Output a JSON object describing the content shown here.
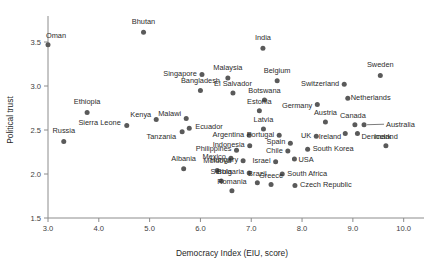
{
  "chart_data": {
    "type": "scatter",
    "title": "",
    "xlabel": "Democracy Index (EIU, score)",
    "ylabel": "Political trust",
    "xlim": [
      3.0,
      10.4
    ],
    "ylim": [
      1.5,
      3.75
    ],
    "xticks": [
      "3.0",
      "4.0",
      "5.0",
      "6.0",
      "7.0",
      "8.0",
      "9.0",
      "10.0"
    ],
    "xtick_values": [
      3.0,
      4.0,
      5.0,
      6.0,
      7.0,
      8.0,
      9.0,
      10.0
    ],
    "yticks": [
      "1.5",
      "2.0",
      "2.5",
      "3.0",
      "3.5"
    ],
    "ytick_values": [
      1.5,
      2.0,
      2.5,
      3.0,
      3.5
    ],
    "grid": false,
    "legend": "none",
    "marker_color": "#5a5a5a",
    "axis_color": "#8c8c8c",
    "points": [
      {
        "label": "Oman",
        "x": 3.0,
        "y": 3.47,
        "lx": 8,
        "ly": -7
      },
      {
        "label": "Russia",
        "x": 3.31,
        "y": 2.37,
        "lx": 0,
        "ly": -8,
        "anchor": "middle"
      },
      {
        "label": "Ethiopia",
        "x": 3.77,
        "y": 2.7,
        "lx": 0,
        "ly": -8,
        "anchor": "middle"
      },
      {
        "label": "Bhutan",
        "x": 4.88,
        "y": 3.61,
        "lx": 0,
        "ly": -8,
        "anchor": "middle"
      },
      {
        "label": "Sierra Leone",
        "x": 4.55,
        "y": 2.55,
        "lx": -6,
        "ly": -1,
        "anchor": "end"
      },
      {
        "label": "Albania",
        "x": 5.67,
        "y": 2.06,
        "lx": 0,
        "ly": -8,
        "anchor": "middle"
      },
      {
        "label": "Kenya",
        "x": 5.13,
        "y": 2.62,
        "lx": -5,
        "ly": -2,
        "anchor": "end"
      },
      {
        "label": "Tanzania",
        "x": 5.64,
        "y": 2.48,
        "lx": -6,
        "ly": 7,
        "anchor": "end"
      },
      {
        "label": "Malawi",
        "x": 5.72,
        "y": 2.63,
        "lx": -5,
        "ly": -3,
        "anchor": "end"
      },
      {
        "label": "Ecuador",
        "x": 5.78,
        "y": 2.52,
        "lx": 6,
        "ly": 1,
        "anchor": "start"
      },
      {
        "label": "Singapore",
        "x": 6.03,
        "y": 3.13,
        "lx": -5,
        "ly": 1,
        "anchor": "end"
      },
      {
        "label": "Bangladesh",
        "x": 6.0,
        "y": 2.95,
        "lx": 0,
        "ly": -7,
        "anchor": "middle"
      },
      {
        "label": "Malaysia",
        "x": 6.54,
        "y": 3.09,
        "lx": 0,
        "ly": -8,
        "anchor": "middle"
      },
      {
        "label": "El Salvador",
        "x": 6.64,
        "y": 2.92,
        "lx": 0,
        "ly": -7,
        "anchor": "middle"
      },
      {
        "label": "Philippines",
        "x": 6.71,
        "y": 2.27,
        "lx": -5,
        "ly": 1,
        "anchor": "end"
      },
      {
        "label": "Mexico",
        "x": 6.6,
        "y": 2.18,
        "lx": -5,
        "ly": 1,
        "anchor": "end"
      },
      {
        "label": "Moldova",
        "x": 6.33,
        "y": 2.04,
        "lx": 0,
        "ly": -7,
        "anchor": "middle"
      },
      {
        "label": "Serbia",
        "x": 6.41,
        "y": 1.92,
        "lx": 0,
        "ly": -7,
        "anchor": "middle"
      },
      {
        "label": "Romania",
        "x": 6.62,
        "y": 1.81,
        "lx": 0,
        "ly": -7,
        "anchor": "middle"
      },
      {
        "label": "Hungary",
        "x": 6.84,
        "y": 2.15,
        "lx": -5,
        "ly": 1,
        "anchor": "end"
      },
      {
        "label": "Bulgaria",
        "x": 6.96,
        "y": 2.01,
        "lx": -5,
        "ly": 1,
        "anchor": "end"
      },
      {
        "label": "Brazil",
        "x": 7.12,
        "y": 1.9,
        "lx": 0,
        "ly": -7,
        "anchor": "middle"
      },
      {
        "label": "Argentina",
        "x": 6.96,
        "y": 2.44,
        "lx": -5,
        "ly": 2,
        "anchor": "end"
      },
      {
        "label": "Indonesia",
        "x": 6.97,
        "y": 2.32,
        "lx": -5,
        "ly": 1,
        "anchor": "end"
      },
      {
        "label": "Israel",
        "x": 7.48,
        "y": 2.14,
        "lx": -5,
        "ly": 1,
        "anchor": "end"
      },
      {
        "label": "Greece",
        "x": 7.39,
        "y": 1.88,
        "lx": 0,
        "ly": -7,
        "anchor": "middle"
      },
      {
        "label": "India",
        "x": 7.23,
        "y": 3.43,
        "lx": 0,
        "ly": -8,
        "anchor": "middle"
      },
      {
        "label": "Latvia",
        "x": 7.24,
        "y": 2.51,
        "lx": 0,
        "ly": -7,
        "anchor": "middle"
      },
      {
        "label": "Portugal",
        "x": 7.55,
        "y": 2.44,
        "lx": -5,
        "ly": 2,
        "anchor": "end"
      },
      {
        "label": "Chile",
        "x": 7.72,
        "y": 2.26,
        "lx": -5,
        "ly": 2,
        "anchor": "end"
      },
      {
        "label": "Spain",
        "x": 7.77,
        "y": 2.35,
        "lx": -5,
        "ly": 1,
        "anchor": "end"
      },
      {
        "label": "Botswana",
        "x": 7.26,
        "y": 2.84,
        "lx": 0,
        "ly": -7,
        "anchor": "middle"
      },
      {
        "label": "Estonia",
        "x": 7.16,
        "y": 2.72,
        "lx": 0,
        "ly": -7,
        "anchor": "middle"
      },
      {
        "label": "Belgium",
        "x": 7.51,
        "y": 3.06,
        "lx": 0,
        "ly": -8,
        "anchor": "middle"
      },
      {
        "label": "South Africa",
        "x": 7.61,
        "y": 2.0,
        "lx": 5,
        "ly": 2,
        "anchor": "start"
      },
      {
        "label": "USA",
        "x": 7.85,
        "y": 2.17,
        "lx": 4,
        "ly": 3,
        "anchor": "start"
      },
      {
        "label": "Czech Republic",
        "x": 7.86,
        "y": 1.87,
        "lx": 5,
        "ly": 2,
        "anchor": "start"
      },
      {
        "label": "UK",
        "x": 8.28,
        "y": 2.43,
        "lx": -5,
        "ly": 2,
        "anchor": "end"
      },
      {
        "label": "South Korea",
        "x": 8.11,
        "y": 2.28,
        "lx": 5,
        "ly": 2,
        "anchor": "start"
      },
      {
        "label": "Germany",
        "x": 8.3,
        "y": 2.79,
        "lx": -5,
        "ly": 4,
        "anchor": "end"
      },
      {
        "label": "Austria",
        "x": 8.46,
        "y": 2.59,
        "lx": 0,
        "ly": -7,
        "anchor": "middle"
      },
      {
        "label": "Switzerland",
        "x": 8.83,
        "y": 3.02,
        "lx": -5,
        "ly": 2,
        "anchor": "end"
      },
      {
        "label": "Netherlands",
        "x": 8.9,
        "y": 2.86,
        "lx": 3,
        "ly": 2,
        "anchor": "start"
      },
      {
        "label": "Ireland",
        "x": 8.85,
        "y": 2.46,
        "lx": -4,
        "ly": 5,
        "anchor": "end"
      },
      {
        "label": "Canada",
        "x": 9.04,
        "y": 2.56,
        "lx": -2,
        "ly": -7,
        "anchor": "middle"
      },
      {
        "label": "Denmark",
        "x": 9.09,
        "y": 2.46,
        "lx": 4,
        "ly": 5,
        "anchor": "start"
      },
      {
        "label": "Australia",
        "x": 9.22,
        "y": 2.56,
        "lx": 22,
        "ly": 2,
        "anchor": "start",
        "leader": true
      },
      {
        "label": "Sweden",
        "x": 9.54,
        "y": 3.12,
        "lx": 0,
        "ly": -8,
        "anchor": "middle"
      },
      {
        "label": "Iceland",
        "x": 9.65,
        "y": 2.32,
        "lx": 0,
        "ly": -7,
        "anchor": "middle"
      }
    ]
  }
}
